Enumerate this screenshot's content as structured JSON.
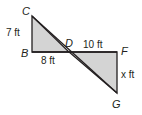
{
  "diagram": {
    "type": "similar-triangles",
    "fill_color": "#d4d4d4",
    "stroke_color": "#231f20",
    "vertices": {
      "C": {
        "label": "C",
        "x": 32,
        "y": 16
      },
      "B": {
        "label": "B",
        "x": 32,
        "y": 52
      },
      "D": {
        "label": "D",
        "x": 69,
        "y": 52
      },
      "F": {
        "label": "F",
        "x": 117,
        "y": 52
      },
      "G": {
        "label": "G",
        "x": 117,
        "y": 93
      }
    },
    "triangles": [
      {
        "name": "triangle-BCD",
        "points": [
          "B",
          "C",
          "D"
        ]
      },
      {
        "name": "triangle-DFG",
        "points": [
          "D",
          "F",
          "G"
        ]
      }
    ],
    "measurements": {
      "CB": "7 ft",
      "BD": "8 ft",
      "DF": "10 ft",
      "FG": "x ft"
    }
  }
}
